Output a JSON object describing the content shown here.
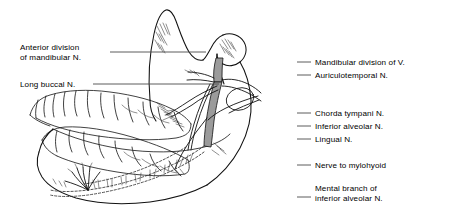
{
  "figure": {
    "style": "black ink line drawing on white background with straight leader lines to text labels",
    "ink_color": "#000000",
    "background_color": "#ffffff",
    "leader_color": "#4a4a4a"
  },
  "labels_left": [
    {
      "name": "anterior-division-of-mandibular-nerve",
      "lines": [
        "Anterior division",
        "of mandibular N."
      ],
      "text_x": 20,
      "text_y": 43,
      "leader_x1": 110,
      "leader_x2": 206,
      "leader_y": 52
    },
    {
      "name": "long-buccal-nerve",
      "lines": [
        "Long buccal N."
      ],
      "text_x": 20,
      "text_y": 80,
      "leader_x1": 93,
      "leader_x2": 219,
      "leader_y": 84
    }
  ],
  "labels_right": [
    {
      "name": "mandibular-division-of-v",
      "lines": [
        "Mandibular division of V."
      ],
      "text_x": 315,
      "text_y": 58,
      "leader_x1": 297,
      "leader_x2": 311,
      "leader_y": 62
    },
    {
      "name": "auriculotemporal-nerve",
      "lines": [
        "Auriculotemporal N."
      ],
      "text_x": 315,
      "text_y": 71,
      "leader_x1": 297,
      "leader_x2": 311,
      "leader_y": 75
    },
    {
      "name": "chorda-tympani-nerve",
      "lines": [
        "Chorda tympani N."
      ],
      "text_x": 315,
      "text_y": 109,
      "leader_x1": 297,
      "leader_x2": 311,
      "leader_y": 113
    },
    {
      "name": "inferior-alveolar-nerve",
      "lines": [
        "Inferior alveolar N."
      ],
      "text_x": 315,
      "text_y": 122,
      "leader_x1": 297,
      "leader_x2": 311,
      "leader_y": 126
    },
    {
      "name": "lingual-nerve",
      "lines": [
        "Lingual N."
      ],
      "text_x": 315,
      "text_y": 135,
      "leader_x1": 297,
      "leader_x2": 311,
      "leader_y": 139
    },
    {
      "name": "nerve-to-mylohyoid",
      "lines": [
        "Nerve to mylohyoid"
      ],
      "text_x": 315,
      "text_y": 161,
      "leader_x1": 297,
      "leader_x2": 311,
      "leader_y": 165
    },
    {
      "name": "mental-branch-of-inferior-alveolar-nerve",
      "lines": [
        "Mental branch of",
        "inferior alveolar N."
      ],
      "text_x": 315,
      "text_y": 184,
      "leader_x1": 297,
      "leader_x2": 311,
      "leader_y": 197
    }
  ],
  "anatomy_parts": [
    {
      "name": "coronoid-process",
      "note": "pointed superior projection of ramus, left of mandibular notch"
    },
    {
      "name": "mandibular-notch",
      "note": "concave notch between coronoid process and condyle"
    },
    {
      "name": "condylar-process",
      "note": "rounded head at top right articulating at temporomandibular joint"
    },
    {
      "name": "ramus-of-mandible",
      "note": "vertical plate of bone below coronoid and condyle"
    },
    {
      "name": "body-of-mandible",
      "note": "horizontal lower jaw bearing the lower teeth"
    },
    {
      "name": "angle-of-mandible",
      "note": "posterior inferior corner where ramus meets body"
    },
    {
      "name": "upper-teeth-row",
      "note": "maxillary dental arch, occlusal and buccal surfaces"
    },
    {
      "name": "lower-teeth-row",
      "note": "mandibular dental arch"
    },
    {
      "name": "inferior-alveolar-nerve-canal",
      "note": "dashed nerve path inside mandibular canal running to mental foramen"
    },
    {
      "name": "nerve-trunk-bundle",
      "note": "descending trunk of mandibular division with shaded branches"
    },
    {
      "name": "mental-foramen-branching",
      "note": "fanned terminal branches at anterior body of mandible"
    }
  ]
}
